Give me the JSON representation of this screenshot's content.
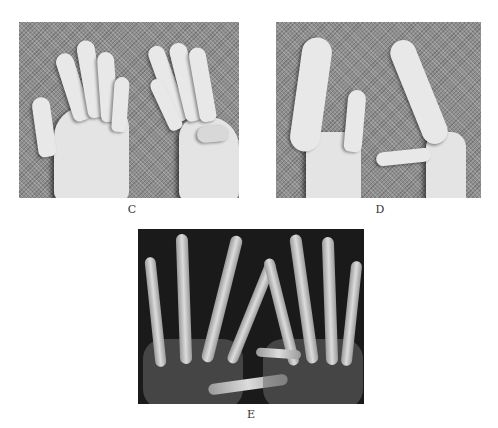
{
  "figure": {
    "panels": [
      {
        "id": "C",
        "label": "C",
        "description": "Photograph of both hands, palmar view, right hand showing short thumb on gray woven background"
      },
      {
        "id": "D",
        "label": "D",
        "description": "Photograph of both hands in lateral view showing thumb positions on gray woven background"
      },
      {
        "id": "E",
        "label": "E",
        "description": "Radiograph (X-ray) of both hands, dorsopalmar view"
      }
    ],
    "colors": {
      "background": "#ffffff",
      "fabric": "#8f8f8f",
      "xray_background": "#1a1a1a",
      "label_text": "#333333"
    }
  }
}
